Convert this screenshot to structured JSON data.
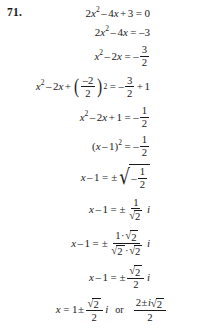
{
  "problem": {
    "number": "71.",
    "method": "completing the square",
    "equation_lines": [
      {
        "id": "line-1",
        "text": "2x^2 - 4x + 3 = 0"
      },
      {
        "id": "line-2",
        "text": "2x^2 - 4x = -3"
      },
      {
        "id": "line-3",
        "text": "x^2 - 2x = -3/2"
      },
      {
        "id": "line-4",
        "text": "x^2 - 2x + ((-2)/2)^2 = -3/2 + 1"
      },
      {
        "id": "line-5",
        "text": "x^2 - 2x + 1 = -1/2"
      },
      {
        "id": "line-6",
        "text": "(x - 1)^2 = -1/2"
      },
      {
        "id": "line-7",
        "text": "x - 1 = ±sqrt(-1/2)"
      },
      {
        "id": "line-8",
        "text": "x - 1 = ± (1/sqrt(2)) i"
      },
      {
        "id": "line-9",
        "text": "x - 1 = ± (1·sqrt(2))/(sqrt(2)·sqrt(2)) i"
      },
      {
        "id": "line-10",
        "text": "x - 1 = ± (sqrt(2)/2) i"
      },
      {
        "id": "line-11",
        "text": "x = 1 ± (sqrt(2)/2) i  or  (2 ± i·sqrt(2))/2"
      }
    ],
    "tokens": {
      "two": "2",
      "three": "3",
      "one": "1",
      "minus_two": "–2",
      "minus": "–",
      "plus": "+",
      "equals": "=",
      "plus_minus": "±",
      "x": "x",
      "i": "i",
      "or": "or",
      "exp_two": "2",
      "neg_three": "–3",
      "radical": "√",
      "radical_tall": "√",
      "paren_left": "(",
      "paren_right": ")",
      "cdot": "·"
    }
  },
  "style": {
    "background": "#ffffff",
    "ink": "#1a1a1a"
  }
}
